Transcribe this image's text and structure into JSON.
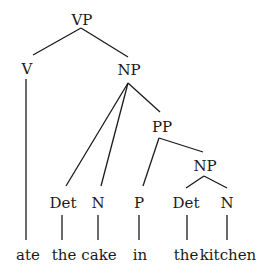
{
  "tree": {
    "nodes": {
      "vp": "VP",
      "v": "V",
      "np": "NP",
      "pp": "PP",
      "det1": "Det",
      "n1": "N",
      "p": "P",
      "np2": "NP",
      "det2": "Det",
      "n2": "N"
    },
    "words": {
      "ate": "ate",
      "the1": "the",
      "cake": "cake",
      "in": "in",
      "the2": "the",
      "kitchen": "kitchen"
    },
    "colors": {
      "ink": "#1a1a1a",
      "background": "#ffffff"
    }
  }
}
